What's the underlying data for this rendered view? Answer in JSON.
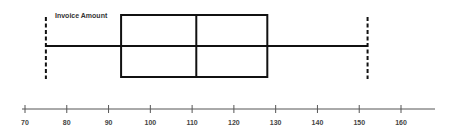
{
  "chart_data": {
    "type": "box",
    "title": "",
    "series_label": "Invoice Amount",
    "min": 75,
    "q1": 93,
    "median": 111,
    "q3": 128,
    "max": 152,
    "xlabel": "",
    "ylabel": "",
    "xlim": [
      70,
      160
    ],
    "ticks": [
      70,
      80,
      90,
      100,
      110,
      120,
      130,
      140,
      150,
      160
    ],
    "grid": false,
    "orientation": "horizontal"
  },
  "colors": {
    "stroke": "#111111",
    "axis": "#555555"
  }
}
